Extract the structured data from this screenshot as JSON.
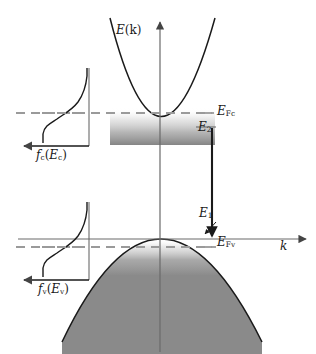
{
  "figure": {
    "type": "physics-band-diagram",
    "axes": {
      "vertical_label": "E(k)",
      "horizontal_label": "k",
      "vertical_axis_x": 160,
      "horizontal_axis_y": 239
    },
    "labels": {
      "energy_axis": {
        "symbol": "E",
        "arg": "(k)"
      },
      "momentum_axis": {
        "symbol": "k"
      },
      "quasi_fermi_conduction": {
        "symbol": "E",
        "sub": "Fc"
      },
      "quasi_fermi_valence": {
        "symbol": "E",
        "sub": "Fv"
      },
      "upper_state": {
        "symbol": "E",
        "sub": "2"
      },
      "lower_state": {
        "symbol": "E",
        "sub": "1"
      },
      "inset_conduction": {
        "symbol": "f",
        "sub": "c",
        "open": "(",
        "arg": "E",
        "arg_sub": "c",
        "close": ")"
      },
      "inset_valence": {
        "symbol": "f",
        "sub": "v",
        "open": "(",
        "arg": "E",
        "arg_sub": "v",
        "close": ")"
      }
    },
    "bands": {
      "conduction": {
        "name": "conduction-band",
        "shape": "upward parabola",
        "minimum": {
          "x": 160,
          "y": 145
        },
        "fill": "gray gradient fading upward, dense at band edge",
        "fill_top_y": 113
      },
      "valence": {
        "name": "valence-band",
        "shape": "downward parabola",
        "maximum": {
          "x": 160,
          "y": 239
        },
        "fill": "gray gradient, light at band edge becoming solid gray below",
        "fill_color": "#8a8a8a"
      }
    },
    "fermi_lines": {
      "conduction_level_y": 113,
      "valence_level_y": 247,
      "style": "dashed",
      "color": "#999999"
    },
    "transition_arrow": {
      "name": "optical-transition-arrow",
      "x": 212,
      "from_y": 130,
      "to_y": 238,
      "direction": "downward",
      "meaning": "stimulated emission transition from E2 to E1"
    },
    "insets": [
      {
        "name": "conduction-fermi-inset",
        "label": "f_c(E_c)",
        "box": {
          "x": 26,
          "y": 68,
          "width": 71,
          "height": 78
        },
        "curve": "Fermi-Dirac occupation factor, S-shaped rising to 1 at top",
        "fermi_tick_y": 113
      },
      {
        "name": "valence-fermi-inset",
        "label": "f_v(E_v)",
        "box": {
          "x": 26,
          "y": 202,
          "width": 71,
          "height": 78
        },
        "curve": "Fermi-Dirac occupation factor, S-shaped rising to 1 at top",
        "fermi_tick_y": 247
      }
    ],
    "colors": {
      "curve": "#1a1a1a",
      "axis": "#555555",
      "dashed": "#999999",
      "band_fill": "#8c8c8c",
      "text": "#1a1a1a",
      "background": "#ffffff"
    }
  }
}
